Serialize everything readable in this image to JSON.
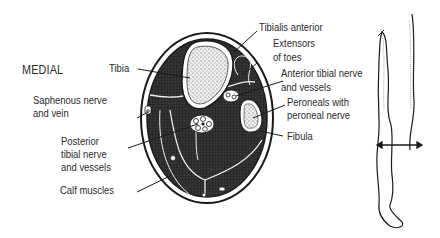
{
  "diagram": {
    "orientation_label": "MEDIAL",
    "labels": {
      "tibia": "Tibia",
      "saphenous_1": "Saphenous nerve",
      "saphenous_2": "and vein",
      "posterior_1": "Posterior",
      "posterior_2": "tibial nerve",
      "posterior_3": "and vessels",
      "calf": "Calf muscles",
      "tibialis": "Tibialis anterior",
      "extensors_1": "Extensors",
      "extensors_2": "of toes",
      "anterior_1": "Anterior tibial nerve",
      "anterior_2": "and vessels",
      "peroneals_1": "Peroneals with",
      "peroneals_2": "peroneal nerve",
      "fibula": "Fibula"
    },
    "colors": {
      "ink": "#1a1a1a",
      "muscle_fill": "#2b2b2b",
      "bone_fill": "#e8e8e8",
      "background": "#ffffff"
    }
  }
}
